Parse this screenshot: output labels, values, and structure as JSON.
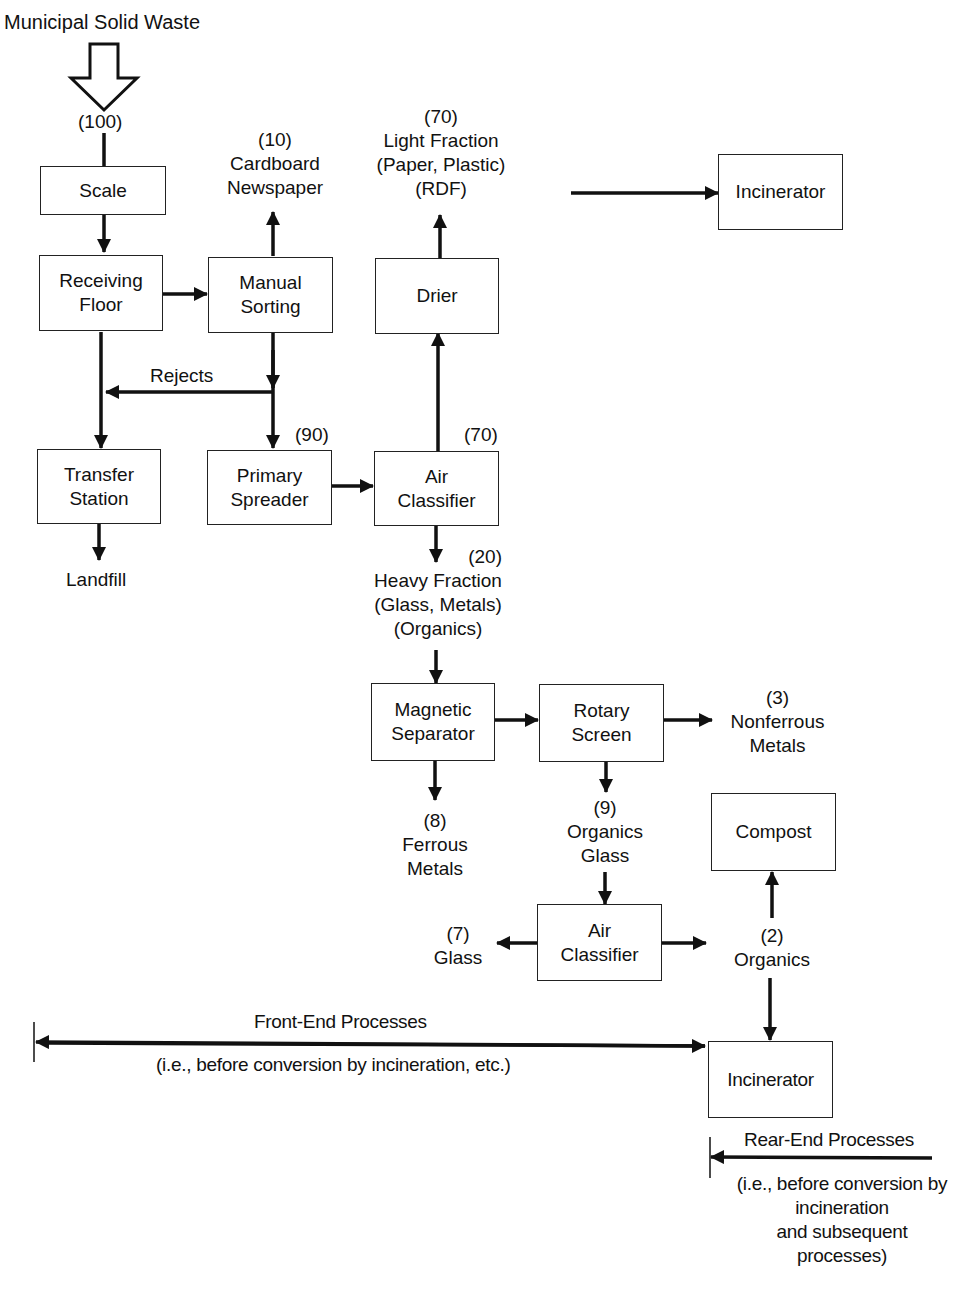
{
  "title": "Municipal Solid Waste",
  "input_amount": "(100)",
  "nodes": {
    "scale": {
      "lines": [
        "Scale"
      ]
    },
    "receiving_floor": {
      "lines": [
        "Receiving",
        "Floor"
      ]
    },
    "manual_sorting": {
      "lines": [
        "Manual",
        "Sorting"
      ]
    },
    "transfer_station": {
      "lines": [
        "Transfer",
        "Station"
      ]
    },
    "primary_spreader": {
      "lines": [
        "Primary",
        "Spreader"
      ]
    },
    "air_classifier_1": {
      "lines": [
        "Air",
        "Classifier"
      ]
    },
    "drier": {
      "lines": [
        "Drier"
      ]
    },
    "incinerator_top": {
      "lines": [
        "Incinerator"
      ]
    },
    "magnetic_separator": {
      "lines": [
        "Magnetic",
        "Separator"
      ]
    },
    "rotary_screen": {
      "lines": [
        "Rotary",
        "Screen"
      ]
    },
    "air_classifier_2": {
      "lines": [
        "Air",
        "Classifier"
      ]
    },
    "compost": {
      "lines": [
        "Compost"
      ]
    },
    "incinerator_bottom": {
      "lines": [
        "Incinerator"
      ]
    }
  },
  "outputs": {
    "cardboard": {
      "lines": [
        "(10)",
        "Cardboard",
        "Newspaper"
      ]
    },
    "light_fraction": {
      "lines": [
        "(70)",
        "Light Fraction",
        "(Paper, Plastic)",
        "(RDF)"
      ]
    },
    "rejects": {
      "lines": [
        "Rejects"
      ]
    },
    "landfill": {
      "lines": [
        "Landfill"
      ]
    },
    "primary_amount": {
      "lines": [
        "(90)"
      ]
    },
    "air_up_amount": {
      "lines": [
        "(70)"
      ]
    },
    "heavy_fraction": {
      "lines": [
        "(20)",
        "Heavy Fraction",
        "(Glass, Metals)",
        "(Organics)"
      ]
    },
    "nonferrous": {
      "lines": [
        "(3)",
        "Nonferrous",
        "Metals"
      ]
    },
    "ferrous": {
      "lines": [
        "(8)",
        "Ferrous",
        "Metals"
      ]
    },
    "organics_glass": {
      "lines": [
        "(9)",
        "Organics",
        "Glass"
      ]
    },
    "glass": {
      "lines": [
        "(7)",
        "Glass"
      ]
    },
    "organics": {
      "lines": [
        "(2)",
        "Organics"
      ]
    }
  },
  "annotations": {
    "front_end_title": "Front-End Processes",
    "front_end_note": "(i.e., before conversion by incineration, etc.)",
    "rear_end_title": "Rear-End Processes",
    "rear_end_note": [
      "(i.e., before conversion by",
      "incineration",
      "and subsequent",
      "processes)"
    ]
  },
  "colors": {
    "ink": "#111111",
    "background": "#ffffff"
  }
}
